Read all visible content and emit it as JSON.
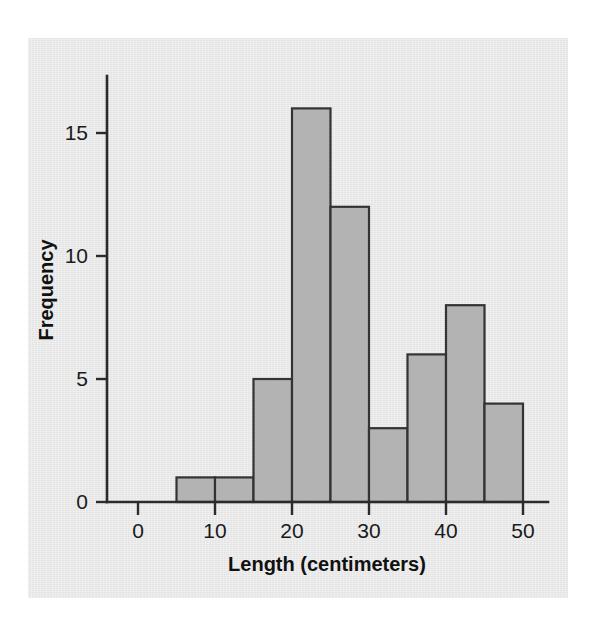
{
  "figure": {
    "background_color": "#ffffff",
    "panel_color": "#e9e9e9"
  },
  "chart_data": {
    "type": "bar",
    "subtype": "histogram",
    "title": "",
    "xlabel": "Length (centimeters)",
    "ylabel": "Frequency",
    "xlim": [
      0,
      53
    ],
    "ylim": [
      0,
      17
    ],
    "xticks": [
      0,
      10,
      20,
      30,
      40,
      50
    ],
    "xtick_labels": [
      "0",
      "10",
      "20",
      "30",
      "40",
      "50"
    ],
    "yticks": [
      0,
      5,
      10,
      15
    ],
    "ytick_labels": [
      "0",
      "5",
      "10",
      "15"
    ],
    "grid": false,
    "legend": false,
    "bin_width": 5,
    "bin_edges": [
      5,
      10,
      15,
      20,
      25,
      30,
      35,
      40,
      45,
      50
    ],
    "categories": [
      "5-10",
      "10-15",
      "15-20",
      "20-25",
      "25-30",
      "30-35",
      "35-40",
      "40-45",
      "45-50"
    ],
    "values": [
      1,
      1,
      5,
      16,
      12,
      3,
      6,
      8,
      4
    ],
    "bar_fill_color": "#b3b3b3",
    "bar_edge_color": "#333333",
    "axis_color": "#2b2b2b"
  }
}
